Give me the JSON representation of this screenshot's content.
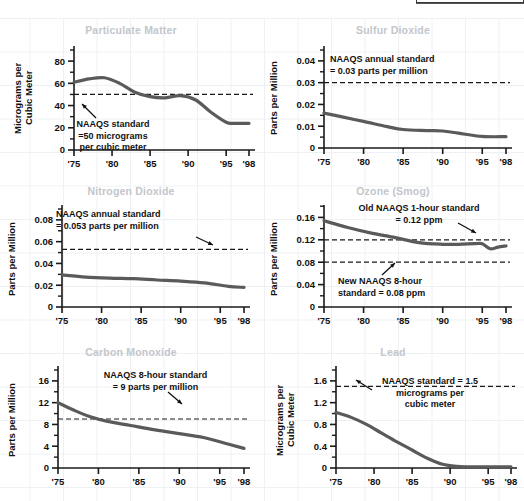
{
  "page": {
    "background_color": "#ffffff",
    "grid_color": "#eef0f3",
    "line_color": "#5a5a5a",
    "axis_color": "#1a1a1a",
    "title_color": "#c3c6cb",
    "text_color": "#111111"
  },
  "charts": [
    {
      "id": "particulate-matter",
      "title": "Particulate Matter",
      "ylabel": "Micrograms per\nCubic Meter",
      "annotation": "NAAQS standard\n=50 micrograms\nper cubic meter",
      "chart_data": {
        "type": "line",
        "title": "Particulate Matter",
        "xlabel": "",
        "ylabel": "Micrograms per Cubic Meter",
        "ylim": [
          0,
          90
        ],
        "yticks": [
          0,
          20,
          40,
          60,
          80
        ],
        "ytick_labels": [
          "0",
          "20",
          "40",
          "60",
          "80"
        ],
        "xlim": [
          1975,
          1998
        ],
        "xticks": [
          1975,
          1980,
          1985,
          1990,
          1995,
          1998
        ],
        "xtick_labels": [
          "'75",
          "'80",
          "'85",
          "'90",
          "'95",
          "'98"
        ],
        "grid": false,
        "legend": "none",
        "x": [
          1975,
          1977,
          1979,
          1981,
          1983,
          1985,
          1987,
          1989,
          1991,
          1993,
          1995,
          1996,
          1998
        ],
        "values": [
          61,
          64,
          65,
          60,
          52,
          48,
          47,
          49,
          45,
          34,
          25,
          24,
          24
        ],
        "reference_lines": [
          {
            "label": "NAAQS standard = 50 micrograms per cubic meter",
            "value": 50,
            "style": "dashed"
          }
        ]
      }
    },
    {
      "id": "sulfur-dioxide",
      "title": "Sulfur Dioxide",
      "ylabel": "Parts per Million",
      "annotation": "NAAQS annual standard\n= 0.03 parts per million",
      "chart_data": {
        "type": "line",
        "title": "Sulfur Dioxide",
        "xlabel": "",
        "ylabel": "Parts per Million",
        "ylim": [
          0,
          0.045
        ],
        "yticks": [
          0,
          0.01,
          0.02,
          0.03,
          0.04
        ],
        "ytick_labels": [
          "0",
          "0.01",
          "0.02",
          "0.03",
          "0.04"
        ],
        "xlim": [
          1975,
          1998
        ],
        "xticks": [
          1975,
          1980,
          1985,
          1990,
          1995,
          1998
        ],
        "xtick_labels": [
          "'75",
          "'80",
          "'85",
          "'90",
          "'95",
          "'98"
        ],
        "grid": false,
        "legend": "none",
        "x": [
          1975,
          1977,
          1980,
          1983,
          1985,
          1988,
          1990,
          1992,
          1995,
          1998
        ],
        "values": [
          0.016,
          0.0145,
          0.0122,
          0.0098,
          0.0085,
          0.008,
          0.0078,
          0.0068,
          0.0053,
          0.0052
        ],
        "reference_lines": [
          {
            "label": "NAAQS annual standard = 0.03 parts per million",
            "value": 0.03,
            "style": "dashed"
          }
        ]
      }
    },
    {
      "id": "nitrogen-dioxide",
      "title": "Nitrogen Dioxide",
      "ylabel": "Parts per Million",
      "annotation": "NAAQS annual standard\n= 0.053 parts per million",
      "chart_data": {
        "type": "line",
        "title": "Nitrogen Dioxide",
        "xlabel": "",
        "ylabel": "Parts per Million",
        "ylim": [
          0,
          0.09
        ],
        "yticks": [
          0,
          0.02,
          0.04,
          0.06,
          0.08
        ],
        "ytick_labels": [
          "0",
          "0.02",
          "0.04",
          "0.06",
          "0.08"
        ],
        "xlim": [
          1975,
          1998
        ],
        "xticks": [
          1975,
          1980,
          1985,
          1990,
          1995,
          1998
        ],
        "xtick_labels": [
          "'75",
          "'80",
          "'85",
          "'90",
          "'95",
          "'98"
        ],
        "grid": false,
        "legend": "none",
        "x": [
          1975,
          1978,
          1981,
          1984,
          1987,
          1990,
          1993,
          1996,
          1998
        ],
        "values": [
          0.0295,
          0.0275,
          0.0265,
          0.026,
          0.0248,
          0.0238,
          0.0222,
          0.019,
          0.018
        ],
        "reference_lines": [
          {
            "label": "NAAQS annual standard = 0.053 parts per million",
            "value": 0.053,
            "style": "dashed"
          }
        ]
      }
    },
    {
      "id": "ozone-smog",
      "title": "Ozone (Smog)",
      "ylabel": "Parts per Million",
      "annotation_old": "Old NAAQS 1-hour standard\n= 0.12 ppm",
      "annotation_new": "New NAAQS 8-hour\nstandard = 0.08 ppm",
      "chart_data": {
        "type": "line",
        "title": "Ozone (Smog)",
        "xlabel": "",
        "ylabel": "Parts per Million",
        "ylim": [
          0,
          0.175
        ],
        "yticks": [
          0,
          0.04,
          0.08,
          0.12,
          0.16
        ],
        "ytick_labels": [
          "0",
          "0.04",
          "0.08",
          "0.12",
          "0.16"
        ],
        "xlim": [
          1975,
          1998
        ],
        "xticks": [
          1975,
          1980,
          1985,
          1990,
          1995,
          1998
        ],
        "xtick_labels": [
          "'75",
          "'80",
          "'85",
          "'90",
          "'95",
          "'98"
        ],
        "grid": false,
        "legend": "none",
        "x": [
          1975,
          1978,
          1981,
          1984,
          1987,
          1990,
          1992,
          1994,
          1995,
          1996,
          1997,
          1998
        ],
        "values": [
          0.154,
          0.142,
          0.132,
          0.124,
          0.115,
          0.112,
          0.112,
          0.113,
          0.113,
          0.104,
          0.107,
          0.109
        ],
        "reference_lines": [
          {
            "label": "Old NAAQS 1-hour standard = 0.12 ppm",
            "value": 0.12,
            "style": "dashed"
          },
          {
            "label": "New NAAQS 8-hour standard = 0.08 ppm",
            "value": 0.08,
            "style": "dashed"
          }
        ]
      }
    },
    {
      "id": "carbon-monoxide",
      "title": "Carbon Monoxide",
      "ylabel": "Parts per Million",
      "annotation": "NAAQS 8-hour standard\n= 9 parts per million",
      "chart_data": {
        "type": "line",
        "title": "Carbon Monoxide",
        "xlabel": "",
        "ylabel": "Parts per Million",
        "ylim": [
          0,
          18
        ],
        "yticks": [
          0,
          4,
          8,
          12,
          16
        ],
        "ytick_labels": [
          "0",
          "4",
          "8",
          "12",
          "16"
        ],
        "xlim": [
          1975,
          1998
        ],
        "xticks": [
          1975,
          1980,
          1985,
          1990,
          1995,
          1998
        ],
        "xtick_labels": [
          "'75",
          "'80",
          "'85",
          "'90",
          "'95",
          "'98"
        ],
        "grid": false,
        "legend": "none",
        "x": [
          1975,
          1977,
          1979,
          1981,
          1984,
          1987,
          1990,
          1993,
          1996,
          1998
        ],
        "values": [
          12.0,
          10.6,
          9.4,
          8.6,
          7.8,
          7.0,
          6.3,
          5.6,
          4.4,
          3.6
        ],
        "reference_lines": [
          {
            "label": "NAAQS 8-hour standard = 9 parts per million",
            "value": 9,
            "style": "dashed"
          }
        ]
      }
    },
    {
      "id": "lead",
      "title": "Lead",
      "ylabel": "Micrograms per\nCubic Meter",
      "annotation": "NAAQS standard = 1.5\nmicrograms per\ncubic meter",
      "chart_data": {
        "type": "line",
        "title": "Lead",
        "xlabel": "",
        "ylabel": "Micrograms per Cubic Meter",
        "ylim": [
          0,
          1.8
        ],
        "yticks": [
          0,
          0.4,
          0.8,
          1.2,
          1.6
        ],
        "ytick_labels": [
          "0",
          "0.4",
          "0.8",
          "1.2",
          "1.6"
        ],
        "xlim": [
          1975,
          1998
        ],
        "xticks": [
          1975,
          1980,
          1985,
          1990,
          1995,
          1998
        ],
        "xtick_labels": [
          "'75",
          "'80",
          "'85",
          "'90",
          "'95",
          "'98"
        ],
        "grid": false,
        "legend": "none",
        "x": [
          1975,
          1977,
          1979,
          1981,
          1983,
          1985,
          1987,
          1989,
          1991,
          1993,
          1995,
          1998
        ],
        "values": [
          1.02,
          0.93,
          0.8,
          0.64,
          0.48,
          0.33,
          0.18,
          0.07,
          0.03,
          0.02,
          0.02,
          0.02
        ],
        "reference_lines": [
          {
            "label": "NAAQS standard = 1.5 micrograms per cubic meter",
            "value": 1.5,
            "style": "dashed"
          }
        ]
      }
    }
  ]
}
